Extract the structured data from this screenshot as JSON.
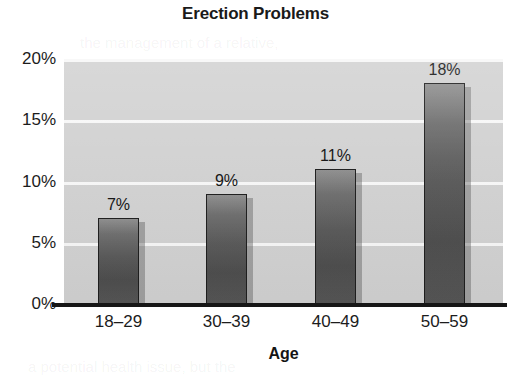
{
  "chart_data": {
    "type": "bar",
    "title": "Erection Problems",
    "xlabel": "Age",
    "ylabel": "",
    "categories": [
      "18–29",
      "30–39",
      "40–49",
      "50–59"
    ],
    "values": [
      7,
      9,
      11,
      18
    ],
    "value_labels": [
      "7%",
      "9%",
      "11%",
      "18%"
    ],
    "ylim": [
      0,
      20
    ],
    "yticks": [
      0,
      5,
      10,
      15,
      20
    ],
    "ytick_labels": [
      "0%",
      "5%",
      "10%",
      "15%",
      "20%"
    ],
    "grid": "horizontal",
    "legend": "none",
    "series": [
      {
        "name": "Erection Problems",
        "values": [
          7,
          9,
          11,
          18
        ]
      }
    ],
    "colors": {
      "plot_background": "#d2d2d2",
      "gridline": "#f7f7f7",
      "bar_fill_top": "#8f8f8f",
      "bar_fill_bottom": "#4e4e4e",
      "bar_border": "#1e1e1e",
      "axis_line": "#161616",
      "text": "#1c1c1c",
      "page_background": "#ffffff"
    }
  },
  "ghosts": {
    "line1": "the management of a relative,",
    "line2": "a potential health issue, but the"
  }
}
